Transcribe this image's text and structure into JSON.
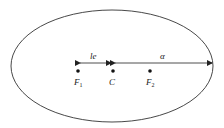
{
  "diagram": {
    "type": "ellipse-foci",
    "colors": {
      "stroke": "#333333",
      "background": "#ffffff"
    },
    "ellipse": {
      "cx": 112,
      "cy": 66,
      "rx": 102,
      "ry": 56
    },
    "points": [
      {
        "id": "F1",
        "label": "F",
        "sub": "1",
        "x": 78,
        "y": 71
      },
      {
        "id": "C",
        "label": "C",
        "sub": "",
        "x": 113,
        "y": 71
      },
      {
        "id": "F2",
        "label": "F",
        "sub": "2",
        "x": 150,
        "y": 71
      }
    ],
    "dimensions": [
      {
        "id": "focal-distance",
        "label": "le",
        "x1": 78,
        "x2": 113,
        "y": 63
      },
      {
        "id": "semi-major-axis",
        "label": "α",
        "x1": 113,
        "x2": 213,
        "y": 63
      }
    ]
  }
}
